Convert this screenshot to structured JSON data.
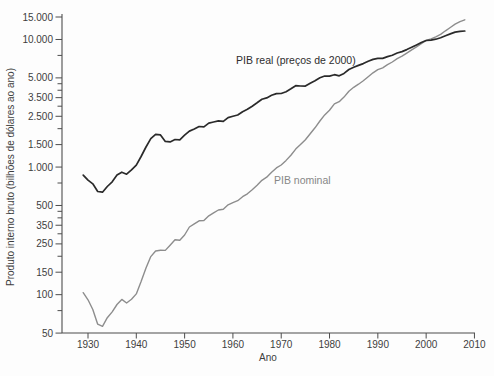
{
  "chart_data": {
    "type": "line",
    "title": "",
    "xlabel": "Ano",
    "ylabel": "Produto interno bruto (bilhões de dólares ao ano)",
    "y_scale": "log",
    "ylim": [
      50,
      15000
    ],
    "xlim": [
      1924.6,
      2010.4
    ],
    "grid": false,
    "legend_position": "inline-annotations",
    "x_ticks": [
      {
        "v": 1930,
        "label": "1930"
      },
      {
        "v": 1940,
        "label": "1940"
      },
      {
        "v": 1950,
        "label": "1950"
      },
      {
        "v": 1960,
        "label": "1960"
      },
      {
        "v": 1970,
        "label": "1970"
      },
      {
        "v": 1980,
        "label": "1980"
      },
      {
        "v": 1990,
        "label": "1990"
      },
      {
        "v": 2000,
        "label": "2000"
      },
      {
        "v": 2010,
        "label": "2010"
      }
    ],
    "y_ticks": [
      {
        "v": 15000,
        "label": "15.000"
      },
      {
        "v": 10000,
        "label": "10.000"
      },
      {
        "v": 5000,
        "label": "5.000"
      },
      {
        "v": 3500,
        "label": "3.500"
      },
      {
        "v": 2500,
        "label": "2.500"
      },
      {
        "v": 1500,
        "label": "1.500"
      },
      {
        "v": 1000,
        "label": "1.000"
      },
      {
        "v": 500,
        "label": "500"
      },
      {
        "v": 350,
        "label": "350"
      },
      {
        "v": 250,
        "label": "250"
      },
      {
        "v": 150,
        "label": "150"
      },
      {
        "v": 100,
        "label": "100"
      },
      {
        "v": 50,
        "label": "50"
      }
    ],
    "y_ticks_minor": [
      7500,
      4500,
      4000,
      3000,
      2000,
      750,
      450,
      400,
      300,
      200,
      75
    ],
    "years": [
      1929,
      1930,
      1931,
      1932,
      1933,
      1934,
      1935,
      1936,
      1937,
      1938,
      1939,
      1940,
      1941,
      1942,
      1943,
      1944,
      1945,
      1946,
      1947,
      1948,
      1949,
      1950,
      1951,
      1952,
      1953,
      1954,
      1955,
      1956,
      1957,
      1958,
      1959,
      1960,
      1961,
      1962,
      1963,
      1964,
      1965,
      1966,
      1967,
      1968,
      1969,
      1970,
      1971,
      1972,
      1973,
      1974,
      1975,
      1976,
      1977,
      1978,
      1979,
      1980,
      1981,
      1982,
      1983,
      1984,
      1985,
      1986,
      1987,
      1988,
      1989,
      1990,
      1991,
      1992,
      1993,
      1994,
      1995,
      1996,
      1997,
      1998,
      1999,
      2000,
      2001,
      2002,
      2003,
      2004,
      2005,
      2006,
      2007,
      2008
    ],
    "series": [
      {
        "name": "PIB real (preços de 2000)",
        "color": "#2a2a2a",
        "values": [
          865.2,
          790.7,
          739.9,
          643.7,
          635.5,
          704.2,
          766.9,
          866.6,
          911.1,
          879.7,
          950.7,
          1034.1,
          1211.1,
          1435.4,
          1670.9,
          1806.5,
          1786.3,
          1589.4,
          1574.5,
          1643.2,
          1634.6,
          1777.3,
          1915.0,
          1988.3,
          2079.5,
          2065.4,
          2212.8,
          2255.8,
          2301.1,
          2279.2,
          2441.3,
          2501.8,
          2560.0,
          2715.2,
          2834.0,
          2998.6,
          3191.1,
          3399.1,
          3484.6,
          3652.7,
          3765.4,
          3771.9,
          3898.6,
          4105.0,
          4341.5,
          4319.6,
          4311.2,
          4540.9,
          4750.5,
          5015.0,
          5173.4,
          5161.7,
          5291.7,
          5189.3,
          5423.8,
          5813.6,
          6053.7,
          6263.6,
          6475.1,
          6742.7,
          6981.4,
          7112.5,
          7100.5,
          7336.6,
          7532.7,
          7835.5,
          8031.7,
          8328.9,
          8703.5,
          9066.9,
          9470.3,
          9817.0,
          9890.7,
          10048.8,
          10301.0,
          10703.5,
          11048.6,
          11415.3,
          11566.8,
          11652.0
        ]
      },
      {
        "name": "PIB nominal",
        "color": "#8d8d8d",
        "values": [
          103.6,
          91.2,
          76.5,
          58.7,
          56.4,
          66.0,
          73.3,
          83.8,
          91.9,
          86.1,
          92.2,
          101.4,
          126.7,
          161.9,
          198.6,
          219.8,
          223.0,
          222.2,
          244.1,
          269.1,
          267.2,
          293.7,
          339.3,
          358.3,
          379.3,
          380.4,
          414.7,
          437.4,
          461.1,
          467.2,
          506.6,
          526.4,
          544.7,
          585.6,
          617.7,
          663.6,
          719.1,
          787.8,
          832.6,
          910.0,
          984.6,
          1038.5,
          1127.1,
          1238.3,
          1382.7,
          1500.0,
          1638.3,
          1825.3,
          2030.9,
          2294.7,
          2563.3,
          2789.5,
          3128.4,
          3255.0,
          3536.7,
          3933.2,
          4220.3,
          4462.8,
          4739.5,
          5103.8,
          5484.4,
          5803.1,
          5995.9,
          6337.7,
          6657.4,
          7072.2,
          7397.7,
          7816.9,
          8304.3,
          8747.0,
          9268.4,
          9817.0,
          10128.0,
          10469.6,
          10960.8,
          11685.9,
          12421.9,
          13178.4,
          13807.5,
          14264.6
        ]
      }
    ]
  }
}
